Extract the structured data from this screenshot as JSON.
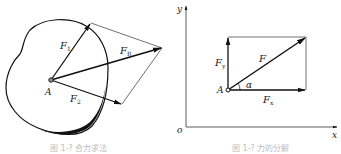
{
  "figures": [
    {
      "id": "left",
      "title": "Parallelogram rule: resultant of two forces at point A on a rigid body",
      "point_label": "A",
      "vectors": [
        {
          "name": "F1",
          "label_main": "F",
          "label_sub": "1"
        },
        {
          "name": "FR",
          "label_main": "F",
          "label_sub": "R"
        },
        {
          "name": "F2",
          "label_main": "F",
          "label_sub": "2"
        }
      ],
      "caption": "图 1-? 合力求法"
    },
    {
      "id": "right",
      "title": "Decomposition of force F into Fx and Fy",
      "axis_y_label": "y",
      "axis_x_label": "x",
      "origin_label": "o",
      "point_label": "A",
      "angle_label": "α",
      "vectors": [
        {
          "name": "F",
          "label_main": "F",
          "label_sub": ""
        },
        {
          "name": "Fy",
          "label_main": "F",
          "label_sub": "y"
        },
        {
          "name": "Fx",
          "label_main": "F",
          "label_sub": "x"
        }
      ],
      "caption": "图 1-? 力的分解"
    }
  ],
  "colors": {
    "ink": "#111111",
    "thin": "#333333",
    "caption": "#bdbdbd",
    "background": "#ffffff"
  }
}
